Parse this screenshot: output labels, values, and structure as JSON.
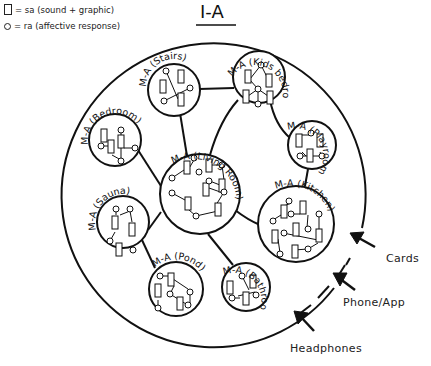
{
  "legend": {
    "items": [
      {
        "symbol": "square",
        "text": "= sa (sound + graphic)"
      },
      {
        "symbol": "circle",
        "text": "= ra (affective response)"
      }
    ]
  },
  "title": "I-A",
  "modules": [
    {
      "id": "stairs",
      "label": "M-A (Stairs)"
    },
    {
      "id": "kids-bedroom",
      "label": "M-A (Kids bedroom)"
    },
    {
      "id": "playroom",
      "label": "M-A (Playroom)"
    },
    {
      "id": "bedroom",
      "label": "M-A (Bedroom)"
    },
    {
      "id": "living-room",
      "label": "M-A (Living Room)"
    },
    {
      "id": "kitchen",
      "label": "M-A (Kitchen)"
    },
    {
      "id": "sauna",
      "label": "M-A (Sauna)"
    },
    {
      "id": "pond",
      "label": "M-A (Pond)"
    },
    {
      "id": "bathroom",
      "label": "M-A (Bathroom)"
    }
  ],
  "inputs": [
    {
      "id": "cards",
      "label": "Cards"
    },
    {
      "id": "phone-app",
      "label": "Phone/App"
    },
    {
      "id": "headphones",
      "label": "Headphones"
    }
  ],
  "colors": {
    "stroke": "#111111",
    "background": "#ffffff"
  }
}
